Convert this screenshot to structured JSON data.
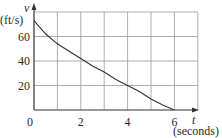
{
  "chart_data": {
    "type": "line",
    "title": "",
    "xlabel": "t",
    "xlabel_unit": "(seconds)",
    "ylabel": "v",
    "ylabel_unit": "(ft/s)",
    "x_ticks": [
      "0",
      "2",
      "4",
      "6"
    ],
    "y_ticks": [
      "20",
      "40",
      "60"
    ],
    "xlim": [
      0,
      7
    ],
    "ylim": [
      0,
      80
    ],
    "grid": true,
    "series": [
      {
        "name": "v(t)",
        "x": [
          0,
          0.5,
          1,
          1.5,
          2,
          2.5,
          3,
          3.5,
          4,
          4.5,
          5,
          5.5,
          6
        ],
        "values": [
          73,
          62,
          54,
          48,
          42,
          36,
          31,
          25,
          20,
          15,
          9,
          4,
          0
        ]
      }
    ],
    "colors": {
      "curve": "#333333",
      "grid": "#9a9a9a",
      "axis": "#333333"
    }
  }
}
